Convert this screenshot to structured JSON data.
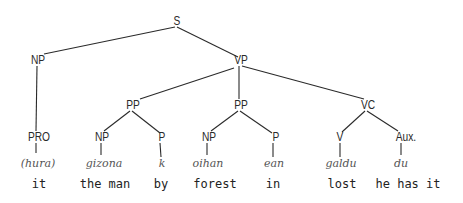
{
  "diagram": {
    "type": "syntax-tree",
    "nodes": {
      "s": {
        "label": "S"
      },
      "np_subj": {
        "label": "NP"
      },
      "vp": {
        "label": "VP"
      },
      "pp1": {
        "label": "PP"
      },
      "pp2": {
        "label": "PP"
      },
      "vc": {
        "label": "VC"
      },
      "pro": {
        "label": "PRO"
      },
      "np1": {
        "label": "NP"
      },
      "p1": {
        "label": "P"
      },
      "np2": {
        "label": "NP"
      },
      "p2": {
        "label": "P"
      },
      "v": {
        "label": "V"
      },
      "aux": {
        "label": "Aux."
      }
    },
    "forms": {
      "pro": "(hura)",
      "np1": "gizona",
      "p1": "k",
      "np2": "oihan",
      "p2": "ean",
      "v": "galdu",
      "aux": "du"
    },
    "glosses": {
      "pro": "it",
      "np1": "the man",
      "p1": "by",
      "np2": "forest",
      "p2": "in",
      "v": "lost",
      "aux": "he has it"
    },
    "line_color": "#2a2a2a"
  }
}
